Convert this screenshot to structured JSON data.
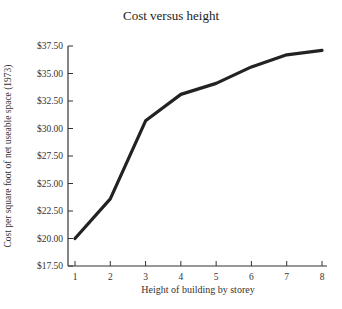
{
  "chart_data": {
    "type": "line",
    "title": "Cost versus height",
    "xlabel": "Height of building by storey",
    "ylabel": "Cost per square foot of net useable space (1973)",
    "x": [
      1,
      2,
      3,
      4,
      5,
      6,
      7,
      8
    ],
    "series": [
      {
        "name": "Cost",
        "values": [
          20.0,
          23.6,
          30.7,
          33.1,
          34.1,
          35.6,
          36.7,
          37.1
        ]
      }
    ],
    "xticks": [
      "1",
      "2",
      "3",
      "4",
      "5",
      "6",
      "7",
      "8"
    ],
    "yticks": [
      "$17.50",
      "$20.00",
      "$22.50",
      "$25.00",
      "$27.50",
      "$30.00",
      "$32.50",
      "$35.00",
      "$37.50"
    ],
    "ytick_values": [
      17.5,
      20,
      22.5,
      25,
      27.5,
      30,
      32.5,
      35,
      37.5
    ],
    "xlim": [
      1,
      8
    ],
    "ylim": [
      17.5,
      37.5
    ],
    "grid": false,
    "legend": null,
    "line_color": "#222222"
  }
}
